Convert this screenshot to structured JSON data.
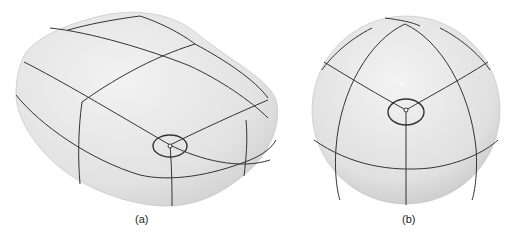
{
  "figure": {
    "panels": [
      {
        "id": "a",
        "caption": "(a)",
        "shape": "rounded box (pillow) with curve network and highlighted 3-valent vertex"
      },
      {
        "id": "b",
        "caption": "(b)",
        "shape": "sphere with curve network and highlighted 3-valent vertex"
      }
    ],
    "colors": {
      "surface": "#e4e4e4",
      "curve": "#333333",
      "background": "#ffffff"
    }
  }
}
